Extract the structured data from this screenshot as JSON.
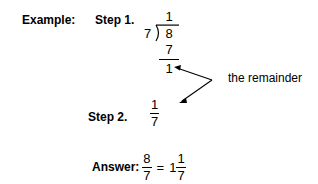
{
  "page": {
    "background_color": "#ffffff",
    "text_color": "#000000",
    "width": 318,
    "height": 184
  },
  "labels": {
    "example": "Example:",
    "step1": "Step 1.",
    "step2": "Step 2.",
    "answer": "Answer:",
    "remainder_callout": "the remainder"
  },
  "long_division": {
    "quotient": "1",
    "divisor": "7",
    "dividend": "8",
    "subtrahend": "7",
    "remainder": "1"
  },
  "step2_fraction": {
    "numerator": "1",
    "denominator": "7"
  },
  "answer": {
    "improper": {
      "numerator": "8",
      "denominator": "7"
    },
    "equals": "=",
    "mixed_whole": "1",
    "mixed_fraction": {
      "numerator": "1",
      "denominator": "7"
    }
  },
  "icons": {
    "division_bracket": "division-bracket",
    "arrow_to_remainder": "double-headed-bent-arrow"
  }
}
